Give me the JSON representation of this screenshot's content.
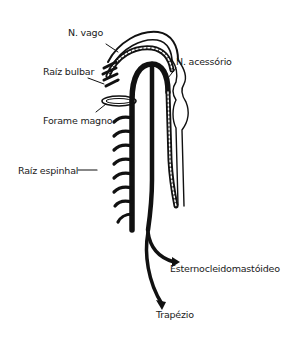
{
  "diagram": {
    "labels": {
      "vago": "N. vago",
      "acessorio": "N. acessório",
      "raiz_bulbar": "Raíz bulbar",
      "forame_magno": "Forame magno",
      "raiz_espinhal": "Raíz espinhal",
      "esternocleidomastoideo": "Esternocleidomastóideo",
      "trapezio": "Trapézio"
    },
    "colors": {
      "ink": "#111111",
      "background": "#ffffff"
    }
  }
}
